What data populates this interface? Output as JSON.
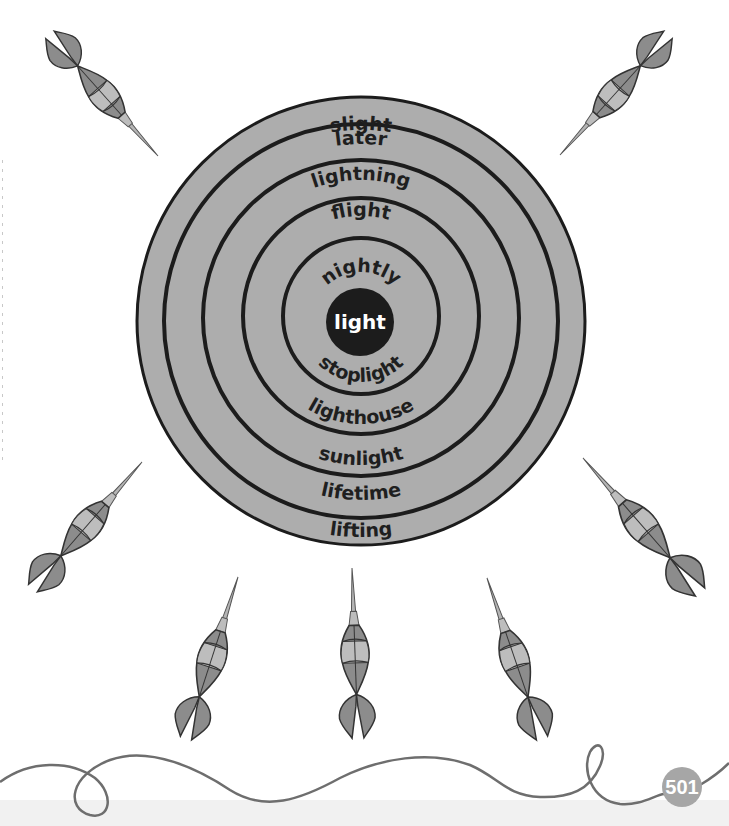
{
  "page": {
    "page_number": "501",
    "colors": {
      "ring_fill": "#adadad",
      "ring_line": "#1c1c1c",
      "bullseye": "#1c1c1c",
      "dart_dark": "#8a8a8a",
      "dart_light": "#b8b8b8",
      "string": "#6e6e6e",
      "page_badge": "#a6a6a6"
    }
  },
  "target": {
    "center_word": "light",
    "rings": [
      {
        "top": "slight",
        "bottom": "lifting"
      },
      {
        "top": "later",
        "bottom": "lifetime"
      },
      {
        "top": "lightning",
        "bottom": "sunlight"
      },
      {
        "top": "flight",
        "bottom": "lighthouse"
      },
      {
        "top": "nightly",
        "bottom": "stoplight"
      }
    ]
  },
  "darts": [
    {
      "name": "dart-top-left"
    },
    {
      "name": "dart-top-right"
    },
    {
      "name": "dart-left"
    },
    {
      "name": "dart-right"
    },
    {
      "name": "dart-bottom-left"
    },
    {
      "name": "dart-bottom-center"
    },
    {
      "name": "dart-bottom-right"
    }
  ]
}
